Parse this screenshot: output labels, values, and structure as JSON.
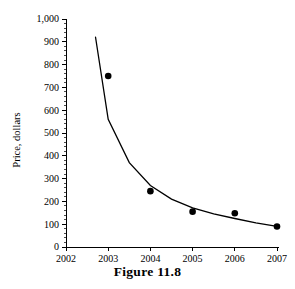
{
  "caption": "Figure 11.8",
  "chart_data": {
    "type": "scatter",
    "title": "",
    "xlabel": "",
    "ylabel": "Price, dollars",
    "x": [
      2003,
      2004,
      2005,
      2006,
      2007
    ],
    "values": [
      750,
      245,
      155,
      148,
      90
    ],
    "series": [
      {
        "name": "Price observations",
        "values": [
          750,
          245,
          155,
          148,
          90
        ]
      },
      {
        "name": "Fitted decay curve",
        "x": [
          2002.7,
          2003,
          2003.5,
          2004,
          2004.5,
          2005,
          2005.5,
          2006,
          2006.5,
          2007
        ],
        "values": [
          920,
          560,
          370,
          270,
          210,
          172,
          145,
          125,
          106,
          90
        ]
      }
    ],
    "xlim": [
      2002,
      2007
    ],
    "ylim": [
      0,
      1000
    ],
    "xticks": [
      2002,
      2003,
      2004,
      2005,
      2006,
      2007
    ],
    "xticklabels": [
      "2002",
      "2003",
      "2004",
      "2005",
      "2006",
      "2007"
    ],
    "yticks": [
      0,
      100,
      200,
      300,
      400,
      500,
      600,
      700,
      800,
      900,
      1000
    ],
    "yticklabels": [
      "0",
      "100",
      "200",
      "300",
      "400",
      "500",
      "600",
      "700",
      "800",
      "900",
      "1,000"
    ],
    "grid": false,
    "legend": "none",
    "minor_ticks_per_interval": 4,
    "marker_color": "#000000",
    "line_color": "#000000"
  }
}
